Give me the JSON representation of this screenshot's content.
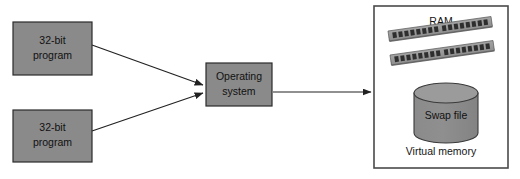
{
  "diagram": {
    "colors": {
      "box_fill": "#8a8a8a",
      "box_stroke": "#2b2b2b",
      "panel_stroke": "#4a4a4a",
      "panel_fill": "#ffffff",
      "arrow": "#222222",
      "cylinder_fill": "#8d8d8d",
      "cylinder_top": "#9a9a9a",
      "ram_body": "#9c9c9c",
      "ram_pin": "#2e2e2e",
      "page_background": "#ffffff"
    },
    "nodes": [
      {
        "id": "program-top",
        "name": "32-bit program (top)",
        "shape": "rectangle",
        "label_line1": "32-bit",
        "label_line2": "program",
        "x": 13,
        "y": 22,
        "width": 79,
        "height": 53
      },
      {
        "id": "program-bottom",
        "name": "32-bit program (bottom)",
        "shape": "rectangle",
        "label_line1": "32-bit",
        "label_line2": "program",
        "x": 13,
        "y": 110,
        "width": 79,
        "height": 52
      },
      {
        "id": "operating-system",
        "name": "Operating system",
        "shape": "rectangle",
        "label_line1": "Operating",
        "label_line2": "system",
        "x": 206,
        "y": 63,
        "width": 66,
        "height": 43
      }
    ],
    "panel": {
      "id": "virtual-memory-panel",
      "x": 374,
      "y": 6,
      "width": 134,
      "height": 162,
      "ram_label": "RAM",
      "caption": "Virtual memory"
    },
    "ram_modules": [
      {
        "id": "ram-stick-1",
        "pin_count": 16
      },
      {
        "id": "ram-stick-2",
        "pin_count": 16
      }
    ],
    "cylinder": {
      "id": "swap-file",
      "label": "Swap file",
      "cx": 446,
      "top_y": 93,
      "rx": 32,
      "ry": 10,
      "body_height": 40
    },
    "arrows": [
      {
        "id": "arrow-program-top-to-os",
        "from": "program-top",
        "to": "operating-system",
        "x1": 92,
        "y1": 45,
        "x2": 204,
        "y2": 85
      },
      {
        "id": "arrow-program-bottom-to-os",
        "from": "program-bottom",
        "to": "operating-system",
        "x1": 92,
        "y1": 131,
        "x2": 204,
        "y2": 93
      },
      {
        "id": "arrow-os-to-virtual-memory",
        "from": "operating-system",
        "to": "virtual-memory-panel",
        "x1": 273,
        "y1": 92,
        "x2": 372,
        "y2": 92
      }
    ]
  }
}
